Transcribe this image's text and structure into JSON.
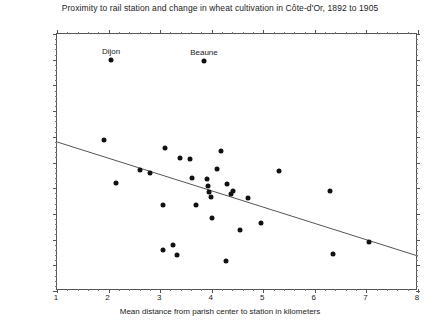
{
  "chart_data": {
    "type": "scatter",
    "title": "Proximity to rail station and change in wheat cultivation in Côte-d'Or, 1892 to 1905",
    "xlabel": "Mean distance from parish center to station in kilometers",
    "ylabel": "Percentage change in hectares of wheat cultivation",
    "xlim": [
      1,
      8
    ],
    "ylim": [
      -30,
      20
    ],
    "xticks": [
      1,
      2,
      3,
      4,
      5,
      6,
      7,
      8
    ],
    "yticks": [
      20,
      15,
      10,
      5,
      0,
      -5,
      -10,
      -15,
      -20,
      -25,
      -30
    ],
    "xtick_labels": [
      "1",
      "2",
      "3",
      "4",
      "5",
      "6",
      "7",
      "8"
    ],
    "ytick_labels": [
      "20",
      "15",
      "10",
      "5",
      "0",
      "-5",
      "-10",
      "-15",
      "-20",
      "-25",
      "-30"
    ],
    "grid": false,
    "legend": null,
    "marker_color": "#111111",
    "trendline_color": "#555555",
    "points": [
      {
        "x": 2.05,
        "y": 15.0,
        "label": "Dijon"
      },
      {
        "x": 3.85,
        "y": 14.8,
        "label": "Beaune"
      },
      {
        "x": 1.92,
        "y": -0.6,
        "label": null
      },
      {
        "x": 2.15,
        "y": -9.0,
        "label": null
      },
      {
        "x": 2.6,
        "y": -6.5,
        "label": null
      },
      {
        "x": 2.8,
        "y": -7.0,
        "label": null
      },
      {
        "x": 3.1,
        "y": -2.2,
        "label": null
      },
      {
        "x": 3.38,
        "y": -4.2,
        "label": null
      },
      {
        "x": 3.58,
        "y": -4.4,
        "label": null
      },
      {
        "x": 3.62,
        "y": -8.0,
        "label": null
      },
      {
        "x": 3.7,
        "y": -13.2,
        "label": null
      },
      {
        "x": 3.9,
        "y": -8.2,
        "label": null
      },
      {
        "x": 3.93,
        "y": -9.6,
        "label": null
      },
      {
        "x": 3.95,
        "y": -10.8,
        "label": null
      },
      {
        "x": 3.98,
        "y": -11.8,
        "label": null
      },
      {
        "x": 4.0,
        "y": -15.8,
        "label": null
      },
      {
        "x": 4.1,
        "y": -6.2,
        "label": null
      },
      {
        "x": 4.18,
        "y": -2.8,
        "label": null
      },
      {
        "x": 4.3,
        "y": -9.2,
        "label": null
      },
      {
        "x": 4.38,
        "y": -11.2,
        "label": null
      },
      {
        "x": 4.42,
        "y": -10.6,
        "label": null
      },
      {
        "x": 4.55,
        "y": -18.2,
        "label": null
      },
      {
        "x": 4.7,
        "y": -12.0,
        "label": null
      },
      {
        "x": 4.95,
        "y": -16.8,
        "label": null
      },
      {
        "x": 5.3,
        "y": -6.6,
        "label": null
      },
      {
        "x": 3.05,
        "y": -13.2,
        "label": null
      },
      {
        "x": 3.05,
        "y": -22.0,
        "label": null
      },
      {
        "x": 3.25,
        "y": -21.0,
        "label": null
      },
      {
        "x": 3.32,
        "y": -23.0,
        "label": null
      },
      {
        "x": 4.28,
        "y": -24.2,
        "label": null
      },
      {
        "x": 6.3,
        "y": -10.6,
        "label": null
      },
      {
        "x": 6.35,
        "y": -22.8,
        "label": null
      },
      {
        "x": 7.05,
        "y": -20.4,
        "label": null
      }
    ],
    "trendline": {
      "x1": 1.0,
      "y1": -1.0,
      "x2": 8.0,
      "y2": -23.2
    }
  }
}
